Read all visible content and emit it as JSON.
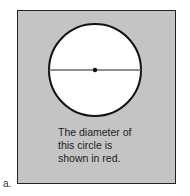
{
  "figure": {
    "label": "a.",
    "caption_lines": [
      "The diameter of",
      "this circle is",
      "shown in red."
    ],
    "colors": {
      "panel": "#c4c4c4",
      "circle_fill": "#ffffff",
      "circle_stroke": "#111111",
      "diameter": "#6a6a6a"
    }
  }
}
